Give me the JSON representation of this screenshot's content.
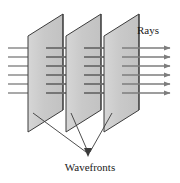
{
  "figure": {
    "background_color": "#ffffff",
    "labels": {
      "rays": "Rays",
      "wavefronts": "Wavefronts"
    },
    "colors": {
      "wavefront_fill": "#c9c9c9",
      "wavefront_fill_light": "#d4d4d4",
      "wavefront_edge": "#2b2b2b",
      "ray_line": "#7d7d7d",
      "leader_line": "#3a3a3a",
      "text": "#1a1a1a"
    },
    "wavefronts": {
      "count": 3,
      "shape": "parallelogram",
      "planes": [
        {
          "name": "wavefront-plane-1",
          "points": "28,36 63,14 63,110 28,132"
        },
        {
          "name": "wavefront-plane-2",
          "points": "66,36 101,14 101,110 66,132"
        },
        {
          "name": "wavefront-plane-3",
          "points": "104,36 139,14 139,110 104,132"
        }
      ]
    },
    "rays": {
      "count": 6,
      "x_start": 8,
      "x_end": 172,
      "y_positions": [
        48,
        57,
        66,
        75,
        84,
        93
      ],
      "arrowhead": "right-pointing-triangle"
    },
    "leaders": {
      "converge_point": {
        "x": 88,
        "y": 155
      },
      "lines": [
        {
          "name": "leader-line-1",
          "from_x": 33,
          "from_y": 113
        },
        {
          "name": "leader-line-2",
          "from_x": 71,
          "from_y": 113
        },
        {
          "name": "leader-line-3",
          "from_x": 109,
          "from_y": 113
        }
      ]
    },
    "rays_label_position": {
      "x": 137,
      "y": 34
    },
    "wavefronts_label_position": {
      "x": 90,
      "y": 171
    }
  }
}
